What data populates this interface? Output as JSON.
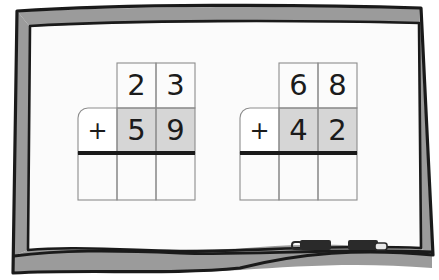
{
  "scene": {
    "name": "whiteboard-math-worksheet",
    "surface_color": "#fbfbfb",
    "frame_color": "#9b9b9b",
    "frame_outline_color": "#1a1a1a",
    "ink_color": "#1b1b1b",
    "grid_line_color": "#8d8d8d",
    "shaded_cell_color": "#d6d6d6",
    "bold_rule_color": "#1a1a1a",
    "marker_color": "#2a2a2a"
  },
  "problems": [
    {
      "id": "problem-left",
      "operator": "+",
      "top_addend": [
        "2",
        "3"
      ],
      "bottom_addend": [
        "5",
        "9"
      ],
      "sum": [
        "",
        "",
        ""
      ],
      "shaded_row": "bottom_addend"
    },
    {
      "id": "problem-right",
      "operator": "+",
      "top_addend": [
        "6",
        "8"
      ],
      "bottom_addend": [
        "4",
        "2"
      ],
      "sum": [
        "",
        "",
        ""
      ],
      "shaded_row": "bottom_addend"
    }
  ],
  "markers": [
    {
      "id": "marker-left",
      "label": ""
    },
    {
      "id": "marker-right",
      "label": ""
    }
  ]
}
